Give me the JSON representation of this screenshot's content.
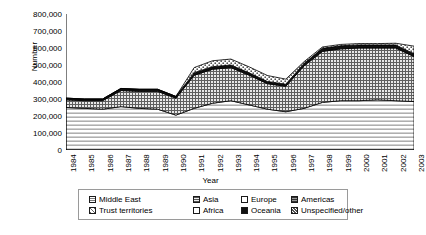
{
  "chart_data": {
    "type": "area",
    "title": "",
    "xlabel": "Year",
    "ylabel": "Number",
    "grid": false,
    "legend_position": "bottom",
    "stacked": true,
    "ylim": [
      0,
      800000
    ],
    "ytick_values": [
      0,
      100000,
      200000,
      300000,
      400000,
      500000,
      600000,
      700000,
      800000
    ],
    "ytick_labels": [
      "0",
      "100,000",
      "200,000",
      "300,000",
      "400,000",
      "500,000",
      "600,000",
      "700,000",
      "800,000"
    ],
    "categories": [
      "1984",
      "1985",
      "1986",
      "1987",
      "1988",
      "1989",
      "1990",
      "1991",
      "1992",
      "1993",
      "1994",
      "1995",
      "1996",
      "1997",
      "1998",
      "1999",
      "2000",
      "2001",
      "2002",
      "2003"
    ],
    "series": [
      {
        "name": "Middle East",
        "pattern": "horizontal-lines",
        "values": [
          250000,
          245000,
          240000,
          255000,
          245000,
          240000,
          205000,
          245000,
          275000,
          290000,
          265000,
          240000,
          225000,
          245000,
          280000,
          290000,
          290000,
          295000,
          290000,
          285000
        ]
      },
      {
        "name": "Asia",
        "pattern": "fine-grid",
        "values": [
          45000,
          45000,
          50000,
          95000,
          100000,
          105000,
          100000,
          195000,
          200000,
          195000,
          175000,
          150000,
          150000,
          250000,
          300000,
          305000,
          310000,
          305000,
          310000,
          265000
        ]
      },
      {
        "name": "Europe",
        "pattern": "solid-white",
        "values": [
          0,
          0,
          0,
          0,
          0,
          0,
          0,
          0,
          0,
          0,
          0,
          0,
          0,
          0,
          0,
          0,
          0,
          0,
          0,
          0
        ]
      },
      {
        "name": "Americas",
        "pattern": "dense-dark",
        "values": [
          0,
          0,
          0,
          0,
          0,
          0,
          0,
          0,
          0,
          0,
          0,
          0,
          0,
          0,
          0,
          0,
          0,
          0,
          0,
          0
        ]
      },
      {
        "name": "Trust territories",
        "pattern": "cross-hatch",
        "values": [
          0,
          0,
          0,
          0,
          0,
          0,
          0,
          0,
          0,
          0,
          0,
          0,
          0,
          0,
          0,
          0,
          0,
          0,
          0,
          0
        ]
      },
      {
        "name": "Africa",
        "pattern": "white",
        "values": [
          0,
          0,
          0,
          0,
          0,
          0,
          0,
          0,
          0,
          0,
          0,
          0,
          0,
          0,
          0,
          0,
          0,
          0,
          0,
          0
        ]
      },
      {
        "name": "Oceania",
        "pattern": "solid-black",
        "values": [
          10000,
          10000,
          10000,
          12000,
          12000,
          12000,
          10000,
          15000,
          15000,
          15000,
          14000,
          13000,
          12000,
          15000,
          18000,
          18000,
          18000,
          18000,
          18000,
          16000
        ]
      },
      {
        "name": "Unspecified/other",
        "pattern": "dotted",
        "values": [
          0,
          0,
          0,
          0,
          0,
          0,
          0,
          30000,
          35000,
          35000,
          35000,
          35000,
          30000,
          10000,
          8000,
          8000,
          8000,
          8000,
          10000,
          45000
        ]
      }
    ],
    "totals": [
      305000,
      300000,
      300000,
      362000,
      357000,
      357000,
      315000,
      485000,
      525000,
      535000,
      489000,
      438000,
      417000,
      520000,
      606000,
      621000,
      626000,
      626000,
      628000,
      611000
    ]
  },
  "legend": {
    "rows": [
      [
        {
          "label": "Middle East",
          "pattern": "horizontal-lines"
        },
        {
          "label": "Asia",
          "pattern": "fine-grid"
        },
        {
          "label": "Europe",
          "pattern": "solid-white"
        },
        {
          "label": "Americas",
          "pattern": "dense-dark"
        }
      ],
      [
        {
          "label": "Trust territories",
          "pattern": "cross-hatch"
        },
        {
          "label": "Africa",
          "pattern": "white"
        },
        {
          "label": "Oceania",
          "pattern": "solid-black"
        },
        {
          "label": "Unspecified/other",
          "pattern": "dotted"
        }
      ]
    ]
  }
}
